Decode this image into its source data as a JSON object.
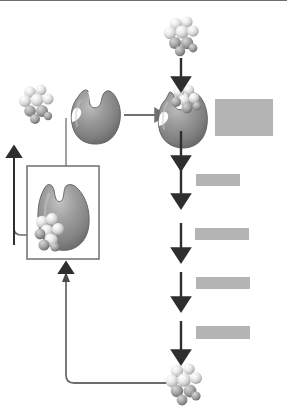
{
  "diagram": {
    "background_color": "#ffffff",
    "ink_color": "#4a4a4a",
    "enzyme_color": "#8a8a8a",
    "enzyme_shadow_color": "#5f5f5f",
    "molecule_color": "#e8e8e8",
    "molecule_shadow_color": "#9a9a9a",
    "redaction_color": "#b4b4b4",
    "top_rule_color": "#6f6f6f"
  },
  "labels": {
    "initial_substrate": "",
    "free_enzyme": "",
    "enzyme_substrate_complex": "",
    "reaction_step_1": "",
    "reaction_step_2": "",
    "reaction_step_3": "",
    "reaction_step_4": "",
    "end_product": "",
    "inhibited_enzyme": ""
  },
  "redactions": [
    {
      "name": "redaction-active-site",
      "x": 215,
      "y": 99,
      "w": 58,
      "h": 37
    },
    {
      "name": "redaction-step-1",
      "x": 196,
      "y": 174,
      "w": 44,
      "h": 12
    },
    {
      "name": "redaction-step-2",
      "x": 195,
      "y": 228,
      "w": 54,
      "h": 12
    },
    {
      "name": "redaction-step-3",
      "x": 196,
      "y": 277,
      "w": 54,
      "h": 12
    },
    {
      "name": "redaction-step-4",
      "x": 196,
      "y": 326,
      "w": 54,
      "h": 13
    }
  ],
  "molecules": [
    {
      "name": "substrate-molecule-top",
      "cx": 181,
      "cy": 36,
      "scale": 1.0
    },
    {
      "name": "substrate-molecule-left",
      "cx": 36,
      "cy": 104,
      "scale": 1.0
    },
    {
      "name": "substrate-in-active-site",
      "cx": 186,
      "cy": 100,
      "scale": 0.86
    },
    {
      "name": "inhibitor-bound-to-enzyme",
      "cx": 48,
      "cy": 230,
      "scale": 0.96
    },
    {
      "name": "end-product-molecule",
      "cx": 183,
      "cy": 383,
      "scale": 1.04
    }
  ],
  "arrows": {
    "substrate_entry": {
      "name": "arrow-substrate-into-enzyme",
      "x": 181,
      "y1": 60,
      "y2": 84
    },
    "binding": {
      "name": "arrow-enzyme-binds-substrate",
      "x1": 124,
      "x2": 163,
      "y": 115
    },
    "catalysis": {
      "name": "arrow-catalysis-step-1",
      "x": 181,
      "y1": 131,
      "y2": 163
    },
    "step2": {
      "name": "arrow-reaction-step-2",
      "x": 181,
      "y1": 168,
      "y2": 200
    },
    "step3": {
      "name": "arrow-reaction-step-3",
      "x": 181,
      "y1": 223,
      "y2": 255
    },
    "step4": {
      "name": "arrow-reaction-step-4",
      "x": 181,
      "y1": 272,
      "y2": 304
    },
    "step5": {
      "name": "arrow-reaction-step-5",
      "x": 181,
      "y1": 321,
      "y2": 356
    },
    "feedback_up": {
      "name": "arrow-feedback-into-inset",
      "x": 66,
      "y1": 383,
      "y2": 265
    },
    "release_up": {
      "name": "arrow-enzyme-release",
      "x": 14,
      "y1": 245,
      "y2": 147
    }
  },
  "inset": {
    "name": "inset-inhibited-enzyme-box",
    "x": 27,
    "y": 166,
    "w": 72,
    "h": 93,
    "border_color": "#6f6f6f"
  },
  "connectors": {
    "enzyme_to_inset": {
      "name": "connector-enzyme-to-inset",
      "description": "vertical line from free enzyme down into inset box"
    },
    "inset_to_release": {
      "name": "connector-inset-to-release-arrow",
      "description": "U-shaped line from inset left edge to upward release arrow"
    },
    "product_to_feedback": {
      "name": "connector-product-to-feedback",
      "description": "line from end product left then up to inset box"
    }
  }
}
